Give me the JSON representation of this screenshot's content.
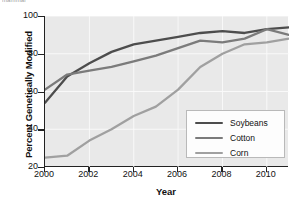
{
  "cutoff_caption": "mammal",
  "chart_data": {
    "type": "line",
    "title": "",
    "xlabel": "Year",
    "ylabel": "Percent Genetically Modified",
    "xlim": [
      2000,
      2011
    ],
    "ylim": [
      20,
      100
    ],
    "grid": true,
    "legend_position": "lower-right-inside",
    "x": [
      2000,
      2001,
      2002,
      2003,
      2004,
      2005,
      2006,
      2007,
      2008,
      2009,
      2010,
      2011
    ],
    "xticks": [
      "2000",
      "2002",
      "2004",
      "2006",
      "2008",
      "2010"
    ],
    "xtick_values": [
      2000,
      2002,
      2004,
      2006,
      2008,
      2010
    ],
    "yticks": [
      "20",
      "40",
      "60",
      "80",
      "100"
    ],
    "ytick_values": [
      20,
      40,
      60,
      80,
      100
    ],
    "series": [
      {
        "name": "Soybeans",
        "color": "#4d4d4d",
        "values": [
          54,
          68,
          75,
          81,
          85,
          87,
          89,
          91,
          92,
          91,
          93,
          94
        ]
      },
      {
        "name": "Cotton",
        "color": "#7b7b7b",
        "values": [
          61,
          69,
          71,
          73,
          76,
          79,
          83,
          87,
          86,
          88,
          93,
          90
        ]
      },
      {
        "name": "Corn",
        "color": "#a0a0a0",
        "values": [
          25,
          26,
          34,
          40,
          47,
          52,
          61,
          73,
          80,
          85,
          86,
          88
        ]
      }
    ]
  },
  "legend": {
    "items": [
      {
        "label": "Soybeans",
        "color": "#4d4d4d"
      },
      {
        "label": "Cotton",
        "color": "#7b7b7b"
      },
      {
        "label": "Corn",
        "color": "#a0a0a0"
      }
    ]
  }
}
